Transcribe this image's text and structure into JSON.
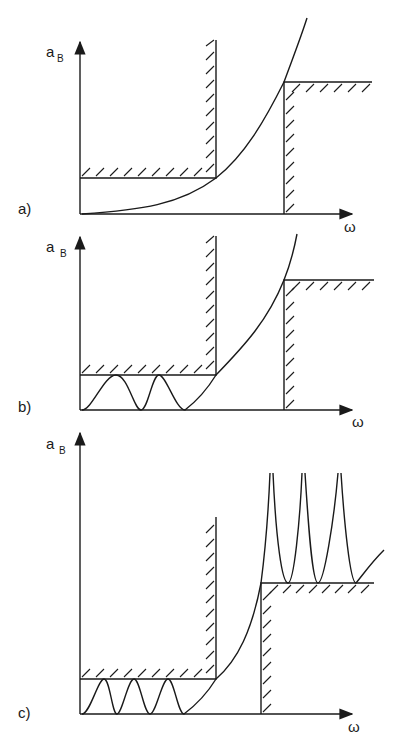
{
  "figure": {
    "panels": [
      {
        "label": "a)",
        "y_axis": "a",
        "y_sub": "B",
        "x_axis": "ω"
      },
      {
        "label": "b)",
        "y_axis": "a",
        "y_sub": "B",
        "x_axis": "ω"
      },
      {
        "label": "c)",
        "y_axis": "a",
        "y_sub": "B",
        "x_axis": "ω"
      }
    ]
  },
  "colors": {
    "ink": "#1a1a1a",
    "background": "#ffffff"
  }
}
